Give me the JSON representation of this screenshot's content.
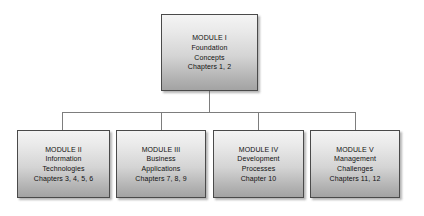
{
  "diagram": {
    "root": {
      "id": "module-1",
      "lines": [
        "MODULE I",
        "Foundation",
        "Concepts",
        "Chapters 1, 2"
      ],
      "label": "MODULE I",
      "subject_line_1": "Foundation",
      "subject_line_2": "Concepts",
      "chapters": "Chapters 1, 2"
    },
    "children": [
      {
        "id": "module-2",
        "label": "MODULE II",
        "subject_line_1": "Information",
        "subject_line_2": "Technologies",
        "chapters": "Chapters 3, 4, 5, 6"
      },
      {
        "id": "module-3",
        "label": "MODULE III",
        "subject_line_1": "Business",
        "subject_line_2": "Applications",
        "chapters": "Chapters 7, 8, 9"
      },
      {
        "id": "module-4",
        "label": "MODULE IV",
        "subject_line_1": "Development",
        "subject_line_2": "Processes",
        "chapters": "Chapter 10"
      },
      {
        "id": "module-5",
        "label": "MODULE V",
        "subject_line_1": "Management",
        "subject_line_2": "Challenges",
        "chapters": "Chapters 11, 12"
      }
    ],
    "colors": {
      "box_border": "#4a4a4a",
      "box_fill_top": "#f4f4f4",
      "box_fill_bottom": "#a3a3a3",
      "connector": "#7d7d7d",
      "text": "#111111",
      "background": "#ffffff"
    }
  }
}
